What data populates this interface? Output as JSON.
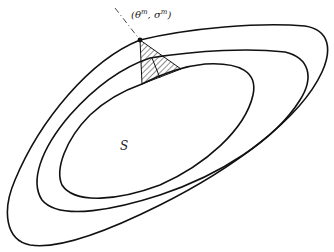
{
  "diagram": {
    "point_label": "(θ^m, σ^m)",
    "point_label_main": "(θ",
    "point_label_sup1": "m",
    "point_label_mid": ", σ",
    "point_label_sup2": "m",
    "point_label_end": ")",
    "region_label": "S",
    "contours": [
      "outer",
      "middle",
      "inner"
    ],
    "hatched_region": "shaded triangular wedge between contours near the point"
  }
}
